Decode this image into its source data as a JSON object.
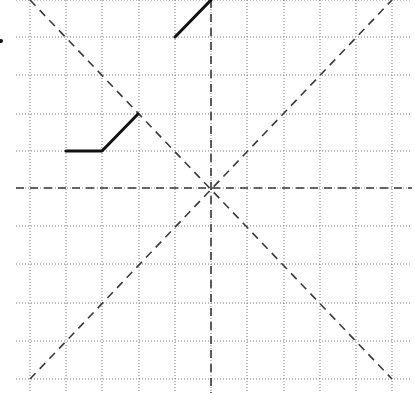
{
  "diagram": {
    "type": "symmetry-grid",
    "grid": {
      "columns": 10,
      "rows": 10,
      "origin_px": [
        30,
        0
      ],
      "cell_width_px": 36.2,
      "cell_height_px": 37.9,
      "x_lines_px": [
        30,
        66,
        102,
        139,
        175,
        211,
        247,
        284,
        320,
        356,
        392
      ],
      "y_lines_px": [
        0,
        37,
        75,
        114,
        151,
        188,
        226,
        264,
        303,
        341,
        379
      ],
      "line_extent_x": [
        16,
        412
      ],
      "line_extent_y": [
        0,
        393
      ],
      "line_color": "#7a7a7a",
      "line_style": "dotted"
    },
    "symmetry_lines": [
      {
        "name": "vertical",
        "from": [
          211,
          0
        ],
        "to": [
          211,
          393
        ]
      },
      {
        "name": "horizontal",
        "from": [
          16,
          188
        ],
        "to": [
          412,
          188
        ]
      },
      {
        "name": "diagonal-down",
        "from": [
          30,
          0
        ],
        "to": [
          392,
          379
        ]
      },
      {
        "name": "diagonal-up",
        "from": [
          30,
          379
        ],
        "to": [
          392,
          0
        ]
      }
    ],
    "center_px": [
      211,
      188
    ],
    "symmetry_color": "#3a3a3a",
    "solid_segments": [
      {
        "name": "top-segment",
        "points": [
          [
            175,
            37
          ],
          [
            211,
            0
          ]
        ]
      },
      {
        "name": "left-polyline",
        "points": [
          [
            66,
            151
          ],
          [
            102,
            151
          ],
          [
            138,
            114
          ]
        ]
      }
    ],
    "solid_color": "#111111",
    "marker_dot": {
      "x": 1,
      "y": 41,
      "r": 2
    }
  }
}
